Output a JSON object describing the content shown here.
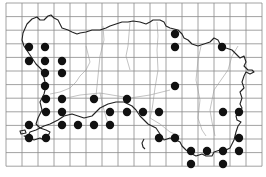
{
  "map": {
    "subject": "Distribution map on grid (island outline with parish boundaries)",
    "colors": {
      "background": "#ffffff",
      "grid": "#8a8a8a",
      "coastline": "#222222",
      "parish_boundary": "#9a9a9a",
      "record_dot": "#111111"
    },
    "grid": {
      "x0": 6,
      "y0": 3,
      "cell_w": 16,
      "cell_h": 13.6,
      "cols": 16,
      "rows": 12
    },
    "record_dots": [
      [
        29,
        47
      ],
      [
        45,
        47
      ],
      [
        29,
        61
      ],
      [
        45,
        61
      ],
      [
        62,
        61
      ],
      [
        45,
        73
      ],
      [
        62,
        73
      ],
      [
        45,
        86
      ],
      [
        175,
        34
      ],
      [
        175,
        47
      ],
      [
        222,
        47
      ],
      [
        175,
        86
      ],
      [
        46,
        99
      ],
      [
        62,
        99
      ],
      [
        94,
        99
      ],
      [
        127,
        99
      ],
      [
        46,
        112
      ],
      [
        62,
        112
      ],
      [
        110,
        112
      ],
      [
        127,
        112
      ],
      [
        143,
        112
      ],
      [
        159,
        112
      ],
      [
        223,
        112
      ],
      [
        239,
        112
      ],
      [
        29,
        125
      ],
      [
        62,
        125
      ],
      [
        78,
        125
      ],
      [
        94,
        125
      ],
      [
        110,
        125
      ],
      [
        29,
        138
      ],
      [
        46,
        138
      ],
      [
        159,
        138
      ],
      [
        175,
        138
      ],
      [
        239,
        138
      ],
      [
        191,
        151
      ],
      [
        207,
        151
      ],
      [
        223,
        151
      ],
      [
        239,
        151
      ],
      [
        191,
        164
      ],
      [
        223,
        164
      ]
    ],
    "dot_radius": 4.2
  }
}
